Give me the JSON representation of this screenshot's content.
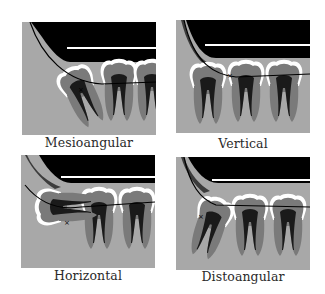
{
  "colors": {
    "background": "#ffffff",
    "bone": "#a8a8a8",
    "tooth": "#7a7a7a",
    "pulp": "#1a1a1a",
    "enamel": "#ffffff",
    "maxilla": "#000000",
    "ramus": "#3c3c3c",
    "caption": "#2a2a2a"
  },
  "panels": [
    {
      "id": "mesioangular",
      "caption": "Mesioangular"
    },
    {
      "id": "vertical",
      "caption": "Vertical"
    },
    {
      "id": "horizontal",
      "caption": "Horizontal"
    },
    {
      "id": "distoangular",
      "caption": "Distoangular"
    }
  ]
}
